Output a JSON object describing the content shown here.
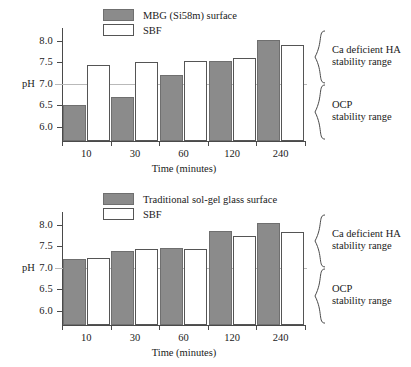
{
  "chart_data": [
    {
      "type": "bar",
      "title": "",
      "xlabel": "Time (minutes)",
      "ylabel": "pH",
      "categories": [
        "10",
        "30",
        "60",
        "120",
        "240"
      ],
      "ylim": [
        5.7,
        8.25
      ],
      "yticks": [
        "8.0",
        "7.5",
        "7.0",
        "6.5",
        "6.0"
      ],
      "ytick_values": [
        8.0,
        7.5,
        7.0,
        6.5,
        6.0
      ],
      "grid": false,
      "legend_position": "top-left",
      "reference_line": 7.0,
      "series": [
        {
          "name": "MBG (Si58m) surface",
          "style": "filled",
          "color": "#8b8b8b",
          "values": [
            6.5,
            6.7,
            7.21,
            7.52,
            8.02
          ]
        },
        {
          "name": "SBF",
          "style": "open",
          "color": "#ffffff",
          "values": [
            7.44,
            7.5,
            7.54,
            7.6,
            7.91
          ]
        }
      ],
      "annotations": [
        {
          "label_line1": "Ca deficient HA",
          "label_line2": "stability range",
          "range": [
            7.0,
            8.25
          ]
        },
        {
          "label_line1": "OCP",
          "label_line2": "stability range",
          "range": [
            5.7,
            7.0
          ]
        }
      ]
    },
    {
      "type": "bar",
      "title": "",
      "xlabel": "Time (minutes)",
      "ylabel": "pH",
      "categories": [
        "10",
        "30",
        "60",
        "120",
        "240"
      ],
      "ylim": [
        5.7,
        8.25
      ],
      "yticks": [
        "8.0",
        "7.5",
        "7.0",
        "6.5",
        "6.0"
      ],
      "ytick_values": [
        8.0,
        7.5,
        7.0,
        6.5,
        6.0
      ],
      "grid": false,
      "legend_position": "top-left",
      "reference_line": 7.0,
      "series": [
        {
          "name": "Traditional sol-gel glass surface",
          "style": "filled",
          "color": "#8b8b8b",
          "values": [
            7.2,
            7.39,
            7.46,
            7.85,
            8.03
          ]
        },
        {
          "name": "SBF",
          "style": "open",
          "color": "#ffffff",
          "values": [
            7.22,
            7.45,
            7.45,
            7.74,
            7.84
          ]
        }
      ],
      "annotations": [
        {
          "label_line1": "Ca deficient HA",
          "label_line2": "stability range",
          "range": [
            7.0,
            8.25
          ]
        },
        {
          "label_line1": "OCP",
          "label_line2": "stability range",
          "range": [
            5.7,
            7.0
          ]
        }
      ]
    }
  ]
}
